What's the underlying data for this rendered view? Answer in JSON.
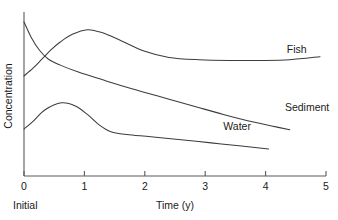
{
  "chart_data": {
    "type": "line",
    "title": "",
    "subtitle": "",
    "xlabel": "Time (y)",
    "ylabel": "Concentration",
    "xlim": [
      0,
      5
    ],
    "ylim": [
      0,
      1
    ],
    "grid": false,
    "legend_position": "inline-right-of-curve",
    "x_ticks": [
      "0",
      "1",
      "2",
      "3",
      "4",
      "5"
    ],
    "x_tick_values": [
      0,
      1,
      2,
      3,
      4,
      5
    ],
    "y_ticks": [],
    "annotations": [
      {
        "text": "Initial",
        "x": 0,
        "placement": "below-x-axis-at-zero"
      }
    ],
    "series": [
      {
        "name": "Fish",
        "label": "Fish",
        "label_x": 4.35,
        "label_y": 0.8,
        "x": [
          0.0,
          0.15,
          0.3,
          0.45,
          0.6,
          0.8,
          1.05,
          1.3,
          1.6,
          2.0,
          2.4,
          2.9,
          3.4,
          3.9,
          4.4,
          4.9
        ],
        "values": [
          0.65,
          0.7,
          0.76,
          0.82,
          0.87,
          0.92,
          0.95,
          0.93,
          0.88,
          0.81,
          0.77,
          0.755,
          0.75,
          0.75,
          0.755,
          0.775
        ]
      },
      {
        "name": "Sediment",
        "label": "Sediment",
        "label_x": 4.32,
        "label_y": 0.42,
        "x": [
          0.0,
          0.12,
          0.25,
          0.4,
          0.6,
          0.9,
          1.3,
          1.8,
          2.3,
          2.8,
          3.3,
          3.8,
          4.1,
          4.4
        ],
        "values": [
          1.0,
          0.9,
          0.82,
          0.76,
          0.72,
          0.675,
          0.625,
          0.565,
          0.51,
          0.455,
          0.4,
          0.35,
          0.325,
          0.3
        ]
      },
      {
        "name": "Water",
        "label": "Water",
        "label_x": 3.3,
        "label_y": 0.3,
        "x": [
          0.0,
          0.15,
          0.35,
          0.62,
          0.85,
          1.05,
          1.25,
          1.45,
          1.7,
          2.1,
          2.6,
          3.1,
          3.6,
          4.05
        ],
        "values": [
          0.305,
          0.355,
          0.43,
          0.475,
          0.455,
          0.4,
          0.33,
          0.285,
          0.27,
          0.255,
          0.235,
          0.215,
          0.195,
          0.175
        ]
      }
    ]
  }
}
